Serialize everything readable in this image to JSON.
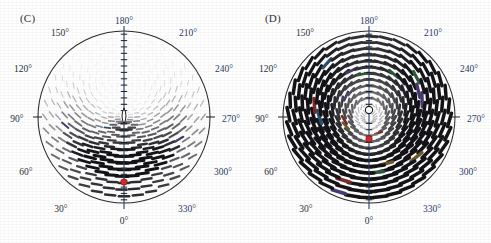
{
  "figure": {
    "background": "#ffffff",
    "width": 491,
    "height": 243
  },
  "panels": [
    {
      "id": "C",
      "label": "(C)",
      "label_x": 20,
      "label_y": 20,
      "center_x": 124,
      "center_y": 117,
      "radius": 86,
      "axis_color": "#2e3f70",
      "circle_color": "#2a2a2a",
      "defect": {
        "name": "defect-core",
        "type": "eye",
        "x": 124,
        "y": 116,
        "rx": 4.0,
        "ry": 8.0,
        "fill": "#ffffff",
        "stroke": "#1d1d1d"
      },
      "marker": {
        "name": "red-marker-dot",
        "x": 124,
        "y": 182,
        "r": 3.2,
        "color": "#d42b2b",
        "stroke": "#8c1414"
      },
      "field": {
        "kind": "director-dashes",
        "rings": 13,
        "ring_step": 6.6,
        "spokes": 36,
        "focus_offset": -30,
        "dark_bias_angle_deg": 180,
        "max_dash_len": 9.5,
        "max_dash_width": 2.6
      },
      "ticks": [
        {
          "label": "0°",
          "angle": 0,
          "x": 124,
          "y": 222,
          "blue": false
        },
        {
          "label": "30°",
          "angle": 30,
          "x": 61,
          "y": 210,
          "blue": false
        },
        {
          "label": "60°",
          "angle": 60,
          "x": 26,
          "y": 173,
          "blue": false
        },
        {
          "label": "90°",
          "angle": 90,
          "x": 17,
          "y": 120,
          "blue": false
        },
        {
          "label": "120°",
          "angle": 120,
          "x": 23,
          "y": 70,
          "blue": false
        },
        {
          "label": "150°",
          "angle": 150,
          "x": 60,
          "y": 34,
          "blue": false
        },
        {
          "label": "180°",
          "angle": 180,
          "x": 124,
          "y": 22,
          "blue": true
        },
        {
          "label": "210°",
          "angle": 210,
          "x": 188,
          "y": 34,
          "blue": true
        },
        {
          "label": "240°",
          "angle": 240,
          "x": 224,
          "y": 70,
          "blue": true
        },
        {
          "label": "270°",
          "angle": 270,
          "x": 231,
          "y": 120,
          "blue": true
        },
        {
          "label": "300°",
          "angle": 300,
          "x": 223,
          "y": 173,
          "blue": true
        },
        {
          "label": "330°",
          "angle": 330,
          "x": 187,
          "y": 210,
          "blue": true
        }
      ]
    },
    {
      "id": "D",
      "label": "(D)",
      "label_x": 20,
      "label_y": 20,
      "center_x": 124,
      "center_y": 117,
      "radius": 86,
      "axis_color": "#2e3f70",
      "circle_color": "#2a2a2a",
      "defect": {
        "name": "defect-core",
        "type": "circle",
        "x": 124,
        "y": 110,
        "rx": 3.6,
        "ry": 3.6,
        "fill": "#ffffff",
        "stroke": "#1d1d1d"
      },
      "marker": {
        "name": "red-marker-dot",
        "x": 124,
        "y": 139,
        "r": 3.2,
        "color": "#d42b2b",
        "stroke": "#8c1414"
      },
      "field": {
        "kind": "director-dashes",
        "rings": 14,
        "ring_step": 6.2,
        "spokes": 36,
        "focus_offset": -7,
        "dark_bias_angle_deg": 180,
        "max_dash_len": 11.0,
        "max_dash_width": 3.0
      },
      "ticks": [
        {
          "label": "0°",
          "angle": 0,
          "x": 124,
          "y": 222,
          "blue": false
        },
        {
          "label": "30°",
          "angle": 30,
          "x": 61,
          "y": 210,
          "blue": false
        },
        {
          "label": "60°",
          "angle": 60,
          "x": 26,
          "y": 173,
          "blue": false
        },
        {
          "label": "90°",
          "angle": 90,
          "x": 17,
          "y": 120,
          "blue": false
        },
        {
          "label": "120°",
          "angle": 120,
          "x": 23,
          "y": 70,
          "blue": false
        },
        {
          "label": "150°",
          "angle": 150,
          "x": 60,
          "y": 34,
          "blue": false
        },
        {
          "label": "180°",
          "angle": 180,
          "x": 124,
          "y": 22,
          "blue": true
        },
        {
          "label": "210°",
          "angle": 210,
          "x": 188,
          "y": 34,
          "blue": true
        },
        {
          "label": "240°",
          "angle": 240,
          "x": 224,
          "y": 70,
          "blue": true
        },
        {
          "label": "270°",
          "angle": 270,
          "x": 231,
          "y": 120,
          "blue": true
        },
        {
          "label": "300°",
          "angle": 300,
          "x": 223,
          "y": 173,
          "blue": true
        },
        {
          "label": "330°",
          "angle": 330,
          "x": 187,
          "y": 210,
          "blue": true
        }
      ]
    }
  ],
  "chart_data": {
    "type": "scatter",
    "title": "",
    "subtitle": "",
    "xlabel": "",
    "ylabel": "",
    "coordinate_system": "polar",
    "angular_unit": "degrees",
    "angular_tick_labels": [
      "0°",
      "30°",
      "60°",
      "90°",
      "120°",
      "150°",
      "180°",
      "210°",
      "240°",
      "270°",
      "300°",
      "330°"
    ],
    "angular_tick_values": [
      0,
      30,
      60,
      90,
      120,
      150,
      180,
      210,
      240,
      270,
      300,
      330
    ],
    "angular_range": [
      0,
      360
    ],
    "angular_tick_step": 30,
    "radial_range": [
      0,
      1
    ],
    "grid": false,
    "legend": null,
    "panels": [
      {
        "panel": "(C)",
        "description": "Polar director field of short dashes on concentric rings; dark thick dashes concentrated in the upper (180-degree) half, faint thin dashes in the lower (0-degree) half.",
        "defect_core": {
          "r": 0.0,
          "theta_deg": 180,
          "shape": "eye",
          "fill": "white"
        },
        "red_marker": {
          "r": 0.76,
          "theta_deg": 0,
          "color": "#d42b2b"
        },
        "ring_count": 13,
        "spokes_per_ring": 36,
        "dash_intensity_peak_theta_deg": 180,
        "dash_intensity_min_theta_deg": 0
      },
      {
        "panel": "(D)",
        "description": "Polar director field of short dashes on concentric rings; bold dashes fill most of the disc with a faint region around the lower-center, open circular defect core slightly above center.",
        "defect_core": {
          "r": 0.08,
          "theta_deg": 180,
          "shape": "open-circle",
          "fill": "white"
        },
        "red_marker": {
          "r": 0.26,
          "theta_deg": 0,
          "color": "#d42b2b"
        },
        "ring_count": 14,
        "spokes_per_ring": 36,
        "dash_intensity_peak_theta_deg": 180,
        "dash_intensity_min_theta_deg": 0
      }
    ]
  }
}
